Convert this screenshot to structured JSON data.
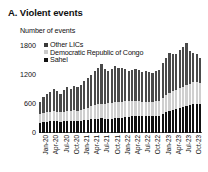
{
  "panel": {
    "title": "A. Violent events",
    "axis_unit": "Number of events"
  },
  "legend": {
    "position": "top-left-inside",
    "items": [
      {
        "label": "Other LICs",
        "color": "#3a3a3a"
      },
      {
        "label": "Democratic Republic of Congo",
        "color": "#c9c9c9"
      },
      {
        "label": "Sahel",
        "color": "#111111"
      }
    ]
  },
  "chart_data": {
    "type": "bar",
    "stacked": true,
    "title": "A. Violent events",
    "subtitle": "",
    "xlabel": "",
    "ylabel": "Number of events",
    "ylim": [
      0,
      1800
    ],
    "yticks": [
      0,
      600,
      1200,
      1800
    ],
    "ytick_labels": [
      "0",
      "600",
      "1200",
      "1800"
    ],
    "grid": false,
    "legend_entries": [
      "Other LICs",
      "Democratic Republic of Congo",
      "Sahel"
    ],
    "xtick_labels": [
      "Jan-20",
      "Apr-20",
      "Jul-20",
      "Oct-20",
      "Jan-21",
      "Apr-21",
      "Jul-21",
      "Oct-21",
      "Jan-22",
      "Apr-22",
      "Jul-22",
      "Oct-22",
      "Jan-23",
      "Apr-23",
      "Jul-23",
      "Oct-23"
    ],
    "xtick_indices": [
      0,
      3,
      6,
      9,
      12,
      15,
      18,
      21,
      24,
      27,
      30,
      33,
      36,
      39,
      42,
      45
    ],
    "categories": [
      "Jan-20",
      "Feb-20",
      "Mar-20",
      "Apr-20",
      "May-20",
      "Jun-20",
      "Jul-20",
      "Aug-20",
      "Sep-20",
      "Oct-20",
      "Nov-20",
      "Dec-20",
      "Jan-21",
      "Feb-21",
      "Mar-21",
      "Apr-21",
      "May-21",
      "Jun-21",
      "Jul-21",
      "Aug-21",
      "Sep-21",
      "Oct-21",
      "Nov-21",
      "Dec-21",
      "Jan-22",
      "Feb-22",
      "Mar-22",
      "Apr-22",
      "May-22",
      "Jun-22",
      "Jul-22",
      "Aug-22",
      "Sep-22",
      "Oct-22",
      "Nov-22",
      "Dec-22",
      "Jan-23",
      "Feb-23",
      "Mar-23",
      "Apr-23",
      "May-23",
      "Jun-23",
      "Jul-23",
      "Aug-23",
      "Sep-23",
      "Oct-23",
      "Nov-23",
      "Dec-23"
    ],
    "series": [
      {
        "name": "Sahel",
        "color": "#111111",
        "values": [
          210,
          225,
          235,
          240,
          250,
          245,
          230,
          240,
          250,
          245,
          255,
          250,
          255,
          265,
          275,
          290,
          295,
          300,
          310,
          300,
          295,
          300,
          310,
          305,
          320,
          330,
          340,
          345,
          350,
          360,
          355,
          345,
          350,
          345,
          355,
          350,
          400,
          430,
          460,
          480,
          500,
          520,
          540,
          560,
          580,
          600,
          610,
          590
        ]
      },
      {
        "name": "Democratic Republic of Congo",
        "color": "#c9c9c9",
        "values": [
          175,
          185,
          190,
          200,
          205,
          200,
          195,
          200,
          205,
          210,
          215,
          210,
          220,
          235,
          250,
          265,
          280,
          290,
          300,
          310,
          320,
          330,
          340,
          335,
          330,
          325,
          320,
          310,
          305,
          300,
          295,
          290,
          285,
          290,
          300,
          310,
          330,
          350,
          370,
          390,
          400,
          410,
          420,
          430,
          440,
          450,
          455,
          440
        ]
      },
      {
        "name": "Other LICs",
        "color": "#3a3a3a",
        "values": [
          265,
          330,
          390,
          410,
          465,
          425,
          385,
          440,
          495,
          455,
          510,
          490,
          525,
          585,
          615,
          650,
          700,
          760,
          810,
          720,
          670,
          690,
          730,
          700,
          690,
          660,
          630,
          645,
          660,
          640,
          620,
          645,
          625,
          605,
          625,
          640,
          720,
          780,
          820,
          770,
          740,
          790,
          830,
          870,
          680,
          600,
          560,
          530
        ]
      }
    ],
    "totals": [
      650,
      740,
      815,
      850,
      920,
      870,
      810,
      880,
      950,
      910,
      980,
      950,
      1000,
      1085,
      1140,
      1205,
      1275,
      1350,
      1420,
      1330,
      1285,
      1320,
      1380,
      1340,
      1340,
      1315,
      1290,
      1300,
      1315,
      1300,
      1270,
      1280,
      1260,
      1240,
      1280,
      1300,
      1450,
      1560,
      1650,
      1640,
      1640,
      1720,
      1790,
      1860,
      1700,
      1650,
      1625,
      1560
    ]
  }
}
